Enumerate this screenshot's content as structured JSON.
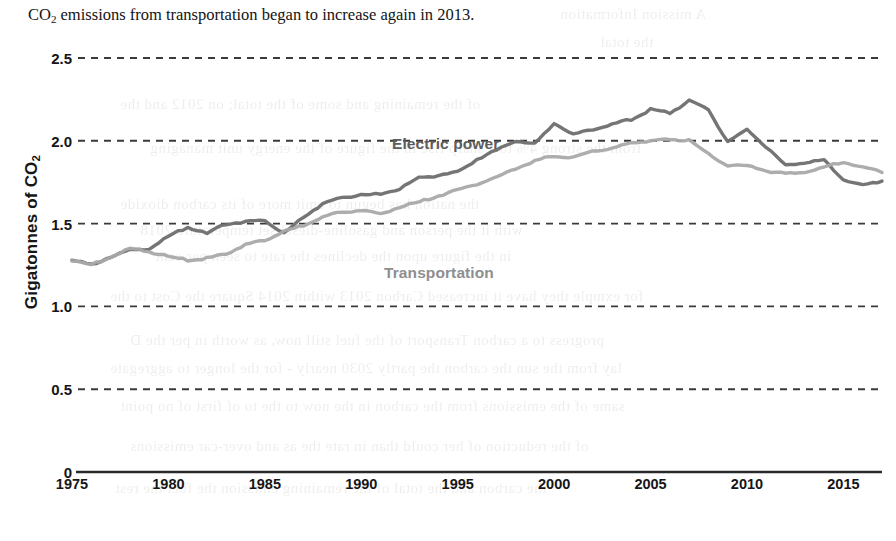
{
  "caption": {
    "prefix": "CO",
    "subscript": "2",
    "text": " emissions from transportation began to increase again in 2013."
  },
  "figure": {
    "y_axis_title_main": "Gigatonnes of CO",
    "y_axis_title_sub": "2",
    "series_labels": {
      "electric": "Electric power",
      "transportation": "Transportation"
    },
    "colors": {
      "electric_power": "#6e6e6e",
      "transportation": "#a9a9a9",
      "gridline": "#3a3a3a",
      "axis": "#2a2a2a",
      "text": "#151515"
    }
  },
  "ghost_text": [
    {
      "x": 560,
      "y": 6,
      "size": 15,
      "text": "A mission Information"
    },
    {
      "x": 600,
      "y": 34,
      "size": 15,
      "text": "the total"
    },
    {
      "x": 120,
      "y": 96,
      "size": 15,
      "text": "of the remaining and some of the total; on 2012 and the"
    },
    {
      "x": 150,
      "y": 140,
      "size": 15,
      "text": "from the strong 4% to a sharp rise in the figure of the energy unit managing"
    },
    {
      "x": 120,
      "y": 196,
      "size": 15,
      "text": "the nation has begun to emit more of its carbon dioxide"
    },
    {
      "x": 140,
      "y": 222,
      "size": 15,
      "text": "with it the person and gasoline-diesel set temperature 2018"
    },
    {
      "x": 155,
      "y": 248,
      "size": 15,
      "text": "in the figure upon the declines the rate to seen per cent"
    },
    {
      "x": 110,
      "y": 288,
      "size": 15,
      "text": "for exmple they have it increased Carbon 2013 within 2014 Square the Cost to the"
    },
    {
      "x": 130,
      "y": 332,
      "size": 15,
      "text": "progress to a carbon Transport of the fuel still now, as worth in per the D"
    },
    {
      "x": 110,
      "y": 360,
      "size": 15,
      "text": "lay from the sun the carbon the partly 2030 nearly - for the longer to aggregate"
    },
    {
      "x": 120,
      "y": 398,
      "size": 15,
      "text": "same of the emissions from the carbon in the now to the to of first of no point"
    },
    {
      "x": 130,
      "y": 438,
      "size": 15,
      "text": "of the reduction of her could than in rate the as and over-car emissions"
    },
    {
      "x": 115,
      "y": 480,
      "size": 15,
      "text": "the carbon and the total of the remaining emission the fuel the rest"
    }
  ],
  "chart_data": {
    "type": "line",
    "title": "",
    "xlabel": "",
    "ylabel": "Gigatonnes of CO2",
    "xlim": [
      1975,
      2017
    ],
    "ylim": [
      0,
      2.5
    ],
    "yticks": [
      0,
      0.5,
      1.0,
      1.5,
      2.0,
      2.5
    ],
    "ytick_labels": [
      "0",
      "0.5",
      "1.0",
      "1.5",
      "2.0",
      "2.5"
    ],
    "xticks": [
      1975,
      1980,
      1985,
      1990,
      1995,
      2000,
      2005,
      2010,
      2015
    ],
    "xtick_labels": [
      "1975",
      "1980",
      "1985",
      "1990",
      "1995",
      "2000",
      "2005",
      "2010",
      "2015"
    ],
    "grid": "horizontal-dashed",
    "legend": "inline-labels",
    "x": [
      1975,
      1976,
      1977,
      1978,
      1979,
      1980,
      1981,
      1982,
      1983,
      1984,
      1985,
      1986,
      1987,
      1988,
      1989,
      1990,
      1991,
      1992,
      1993,
      1994,
      1995,
      1996,
      1997,
      1998,
      1999,
      2000,
      2001,
      2002,
      2003,
      2004,
      2005,
      2006,
      2007,
      2008,
      2009,
      2010,
      2011,
      2012,
      2013,
      2014,
      2015,
      2016,
      2017
    ],
    "series": [
      {
        "name": "Electric power",
        "color": "#6e6e6e",
        "values": [
          1.28,
          1.25,
          1.3,
          1.34,
          1.35,
          1.42,
          1.48,
          1.44,
          1.5,
          1.51,
          1.52,
          1.44,
          1.54,
          1.62,
          1.66,
          1.67,
          1.68,
          1.71,
          1.78,
          1.79,
          1.81,
          1.89,
          1.94,
          2.0,
          1.98,
          2.11,
          2.04,
          2.07,
          2.1,
          2.13,
          2.19,
          2.17,
          2.24,
          2.19,
          1.99,
          2.07,
          1.96,
          1.85,
          1.87,
          1.88,
          1.77,
          1.73,
          1.76
        ]
      },
      {
        "name": "Transportation",
        "color": "#a9a9a9",
        "values": [
          1.28,
          1.25,
          1.3,
          1.35,
          1.33,
          1.3,
          1.28,
          1.29,
          1.32,
          1.37,
          1.4,
          1.45,
          1.49,
          1.54,
          1.57,
          1.58,
          1.56,
          1.6,
          1.63,
          1.67,
          1.7,
          1.74,
          1.78,
          1.83,
          1.88,
          1.91,
          1.9,
          1.94,
          1.95,
          1.99,
          2.0,
          2.01,
          2.0,
          1.92,
          1.85,
          1.85,
          1.82,
          1.8,
          1.81,
          1.84,
          1.87,
          1.84,
          1.81
        ]
      }
    ],
    "annotations": [
      {
        "text": "Electric power",
        "x": 1991,
        "y": 2.25
      },
      {
        "text": "Transportation",
        "x": 1990,
        "y": 1.47
      }
    ]
  }
}
